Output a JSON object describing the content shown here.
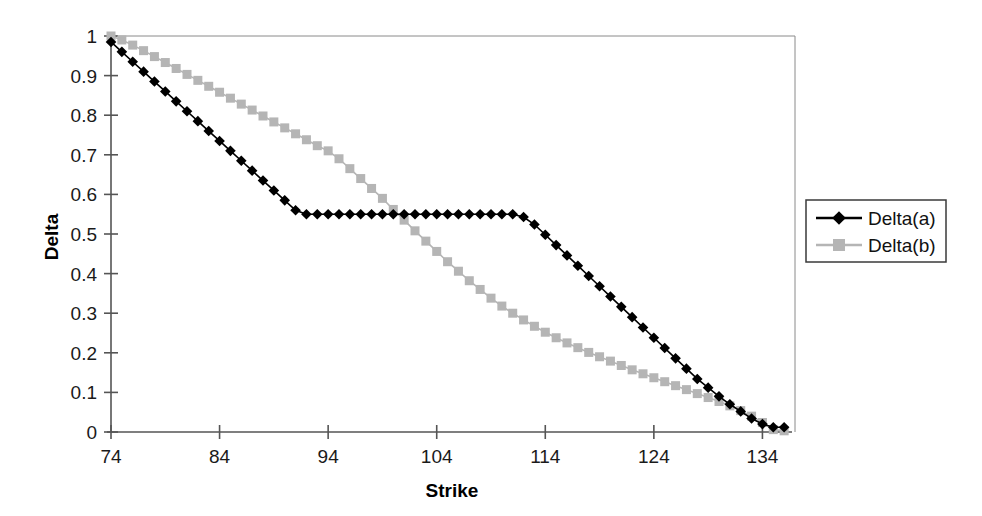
{
  "chart_data": {
    "type": "line",
    "title": "",
    "xlabel": "Strike",
    "ylabel": "Delta",
    "xlim": [
      74,
      137
    ],
    "ylim": [
      0,
      1
    ],
    "xticks": [
      74,
      84,
      94,
      104,
      114,
      124,
      134
    ],
    "yticks": [
      0,
      0.1,
      0.2,
      0.3,
      0.4,
      0.5,
      0.6,
      0.7,
      0.8,
      0.9,
      1
    ],
    "xtick_labels": [
      "74",
      "84",
      "94",
      "104",
      "114",
      "124",
      "134"
    ],
    "ytick_labels": [
      "0",
      "0.1",
      "0.2",
      "0.3",
      "0.4",
      "0.5",
      "0.6",
      "0.7",
      "0.8",
      "0.9",
      "1"
    ],
    "grid": false,
    "legend_position": "right",
    "legend_entries": [
      "Delta(a)",
      "Delta(b)"
    ],
    "series": [
      {
        "name": "Delta(a)",
        "color": "#000000",
        "marker": "diamond",
        "marker_size": 8,
        "line_width": 1.6,
        "x": [
          74,
          75,
          76,
          77,
          78,
          79,
          80,
          81,
          82,
          83,
          84,
          85,
          86,
          87,
          88,
          89,
          90,
          91,
          92,
          93,
          94,
          95,
          96,
          97,
          98,
          99,
          100,
          101,
          102,
          103,
          104,
          105,
          106,
          107,
          108,
          109,
          110,
          111,
          112,
          113,
          114,
          115,
          116,
          117,
          118,
          119,
          120,
          121,
          122,
          123,
          124,
          125,
          126,
          127,
          128,
          129,
          130,
          131,
          132,
          133,
          134,
          135,
          136
        ],
        "y": [
          0.985,
          0.96,
          0.935,
          0.91,
          0.885,
          0.86,
          0.835,
          0.81,
          0.785,
          0.76,
          0.735,
          0.71,
          0.685,
          0.66,
          0.635,
          0.61,
          0.585,
          0.56,
          0.55,
          0.55,
          0.55,
          0.55,
          0.55,
          0.55,
          0.55,
          0.55,
          0.55,
          0.55,
          0.55,
          0.55,
          0.55,
          0.55,
          0.55,
          0.55,
          0.55,
          0.55,
          0.55,
          0.55,
          0.543,
          0.524,
          0.498,
          0.472,
          0.446,
          0.42,
          0.394,
          0.368,
          0.342,
          0.316,
          0.29,
          0.264,
          0.238,
          0.212,
          0.186,
          0.16,
          0.134,
          0.112,
          0.09,
          0.07,
          0.052,
          0.034,
          0.02,
          0.012,
          0.012
        ]
      },
      {
        "name": "Delta(b)",
        "color": "#b5b5b5",
        "marker": "square",
        "marker_size": 9,
        "line_width": 1.6,
        "x": [
          74,
          75,
          76,
          77,
          78,
          79,
          80,
          81,
          82,
          83,
          84,
          85,
          86,
          87,
          88,
          89,
          90,
          91,
          92,
          93,
          94,
          95,
          96,
          97,
          98,
          99,
          100,
          101,
          102,
          103,
          104,
          105,
          106,
          107,
          108,
          109,
          110,
          111,
          112,
          113,
          114,
          115,
          116,
          117,
          118,
          119,
          120,
          121,
          122,
          123,
          124,
          125,
          126,
          127,
          128,
          129,
          130,
          131,
          132,
          133,
          134,
          135,
          136
        ],
        "y": [
          1.0,
          0.99,
          0.977,
          0.963,
          0.948,
          0.933,
          0.918,
          0.903,
          0.888,
          0.873,
          0.858,
          0.843,
          0.828,
          0.813,
          0.798,
          0.783,
          0.768,
          0.753,
          0.738,
          0.723,
          0.71,
          0.69,
          0.665,
          0.64,
          0.615,
          0.59,
          0.562,
          0.535,
          0.508,
          0.482,
          0.456,
          0.43,
          0.406,
          0.382,
          0.36,
          0.338,
          0.318,
          0.3,
          0.283,
          0.267,
          0.252,
          0.238,
          0.225,
          0.213,
          0.201,
          0.19,
          0.179,
          0.168,
          0.157,
          0.147,
          0.137,
          0.127,
          0.117,
          0.107,
          0.097,
          0.087,
          0.077,
          0.066,
          0.054,
          0.04,
          0.024,
          0.006,
          0.003
        ]
      }
    ]
  },
  "legend": {
    "items": [
      {
        "label": "Delta(a)",
        "color": "#000000",
        "marker": "diamond"
      },
      {
        "label": "Delta(b)",
        "color": "#b5b5b5",
        "marker": "square"
      }
    ]
  },
  "axes": {
    "x_title": "Strike",
    "y_title": "Delta"
  }
}
